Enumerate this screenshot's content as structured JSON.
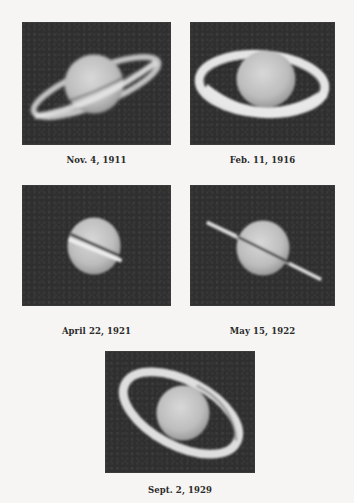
{
  "figure": {
    "panels": [
      {
        "caption": "Nov. 4, 1911",
        "subject": "saturn-rings-tilted"
      },
      {
        "caption": "Feb. 11, 1916",
        "subject": "saturn-rings-wide-open"
      },
      {
        "caption": "April 22, 1921",
        "subject": "saturn-rings-edge-on"
      },
      {
        "caption": "May 15, 1922",
        "subject": "saturn-rings-nearly-edge-on"
      },
      {
        "caption": "Sept. 2, 1929",
        "subject": "saturn-rings-open-tilted"
      }
    ],
    "colors": {
      "page_background": "#f6f5f3",
      "photo_background": "#2f2f2f",
      "planet": "#cfcfcf",
      "rings": "#e2e2e2",
      "caption_text": "#2a2a2a"
    }
  }
}
